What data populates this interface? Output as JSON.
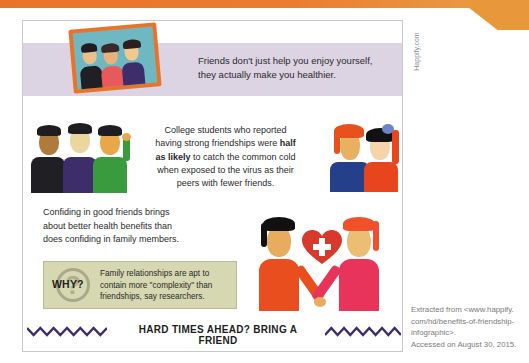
{
  "side_credit": "Happify.com",
  "intro": {
    "line1": "Friends don't just help you enjoy yourself,",
    "line2": "they actually make you healthier."
  },
  "college": {
    "line1": "College students who reported",
    "line2_pre": "having strong friendships were ",
    "line2_bold": "half",
    "line3_bold": "as likely",
    "line3_post": " to catch the common cold",
    "line4": "when exposed to the virus as their",
    "line5": "peers with fewer friends."
  },
  "confide": {
    "line1": "Confiding in good friends brings",
    "line2": "about better health benefits than",
    "line3": "does confiding in family members."
  },
  "why_box": {
    "label": "WHY?",
    "line1": "Family relationships are apt to",
    "line2": "contain more \"complexity\" than",
    "line3": "friendships, say researchers."
  },
  "footer_title": "HARD TIMES AHEAD? BRING A FRIEND",
  "source": {
    "line1": "Extracted from <www.happify.",
    "line2": "com/hd/benefits-of-friendship-",
    "line3": "infographic>.",
    "line4": "Accessed on August 30, 2015."
  },
  "icons": {
    "photo": "group-photo-icon",
    "heart": "heart-plus-icon",
    "wave": "zigzag-wave-icon"
  },
  "colors": {
    "orange_band": "#e8742a",
    "purple_band": "#dcd3e3",
    "why_box": "#d6d8b2",
    "wave": "#3d2e6b",
    "heart": "#d63a2c"
  }
}
